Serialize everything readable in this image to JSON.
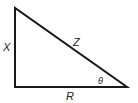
{
  "diagram": {
    "type": "right-triangle",
    "vertices": {
      "top": [
        15,
        8
      ],
      "right_angle": [
        15,
        87
      ],
      "acute": [
        127,
        87
      ]
    },
    "stroke_color": "#1a1a1a",
    "labels": {
      "vertical_side": "X",
      "hypotenuse": "Z",
      "horizontal_side": "R",
      "angle": "θ"
    }
  }
}
